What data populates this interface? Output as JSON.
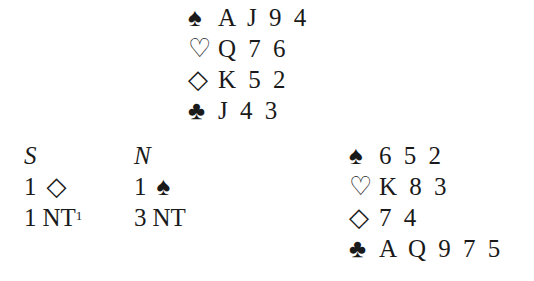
{
  "north_hand": {
    "spades": {
      "suit_icon": "♠",
      "cards": "A J 9 4"
    },
    "hearts": {
      "suit_icon": "♡",
      "cards": "Q 7 6"
    },
    "diamonds": {
      "suit_icon": "◇",
      "cards": "K 5 2"
    },
    "clubs": {
      "suit_icon": "♣",
      "cards": "J 4 3"
    }
  },
  "east_hand": {
    "spades": {
      "suit_icon": "♠",
      "cards": "6 5 2"
    },
    "hearts": {
      "suit_icon": "♡",
      "cards": "K 8 3"
    },
    "diamonds": {
      "suit_icon": "◇",
      "cards": "7 4"
    },
    "clubs": {
      "suit_icon": "♣",
      "cards": "A Q 9 7 5"
    }
  },
  "auction": {
    "columns": [
      {
        "header": "S",
        "bids": [
          {
            "level": "1",
            "strain_icon": "◇",
            "text": "",
            "footnote": ""
          },
          {
            "level": "1",
            "strain_icon": "",
            "text": "NT",
            "footnote": "1"
          }
        ]
      },
      {
        "header": "N",
        "bids": [
          {
            "level": "1",
            "strain_icon": "♠",
            "text": "",
            "footnote": ""
          },
          {
            "level": "3",
            "strain_icon": "",
            "text": "NT",
            "footnote": ""
          }
        ]
      }
    ]
  }
}
